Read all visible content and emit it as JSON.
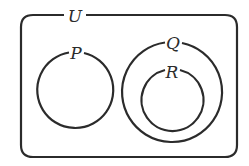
{
  "diagram": {
    "type": "venn",
    "stroke_color": "#2b2b2b",
    "background": "#ffffff",
    "universe": {
      "label": "U"
    },
    "sets": [
      {
        "label": "P",
        "relation": "disjoint from Q and R"
      },
      {
        "label": "Q",
        "relation": "contains R"
      },
      {
        "label": "R",
        "relation": "subset of Q"
      }
    ]
  }
}
